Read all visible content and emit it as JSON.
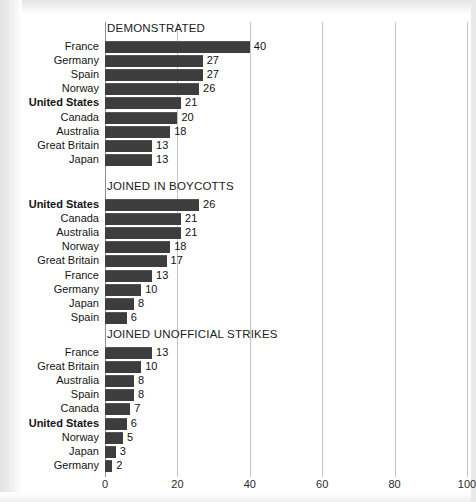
{
  "chart_data": {
    "type": "bar",
    "title": "",
    "orientation": "horizontal",
    "xlabel": "",
    "ylabel": "",
    "xlim": [
      0,
      100
    ],
    "xticks": [
      0,
      20,
      40,
      60,
      80,
      100
    ],
    "xtick_labels": [
      "0",
      "20",
      "40",
      "60",
      "80",
      "100"
    ],
    "grid": true,
    "legend": null,
    "panels": [
      {
        "title": "DEMONSTRATED",
        "categories": [
          "France",
          "Germany",
          "Spain",
          "Norway",
          "United States",
          "Canada",
          "Australia",
          "Great Britain",
          "Japan"
        ],
        "values": [
          40,
          27,
          27,
          26,
          21,
          20,
          18,
          13,
          13
        ],
        "highlight": "United States"
      },
      {
        "title": "JOINED IN BOYCOTTS",
        "categories": [
          "United States",
          "Canada",
          "Australia",
          "Norway",
          "Great Britain",
          "France",
          "Germany",
          "Japan",
          "Spain"
        ],
        "values": [
          26,
          21,
          21,
          18,
          17,
          13,
          10,
          8,
          6
        ],
        "highlight": "United States"
      },
      {
        "title": "JOINED UNOFFICIAL STRIKES",
        "categories": [
          "France",
          "Great Britain",
          "Australia",
          "Spain",
          "Canada",
          "United States",
          "Norway",
          "Japan",
          "Germany"
        ],
        "values": [
          13,
          10,
          8,
          8,
          7,
          6,
          5,
          3,
          2
        ],
        "highlight": "United States"
      }
    ],
    "colors": {
      "bar": "#3d3d3d",
      "gridline": "#c4c4c4",
      "axis": "#8f8f8f",
      "text": "#151515",
      "background": "#ffffff"
    }
  }
}
